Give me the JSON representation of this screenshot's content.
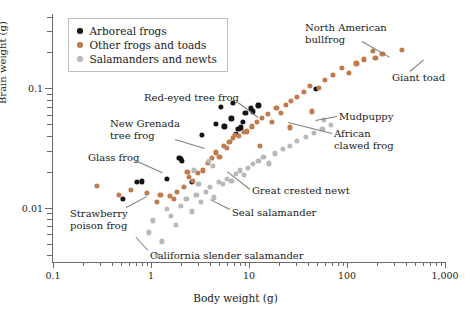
{
  "chart_data": {
    "type": "scatter",
    "title": "",
    "xlabel": "Body weight (g)",
    "ylabel": "Brain weight (g)",
    "xscale": "log",
    "yscale": "log",
    "xlim": [
      0.1,
      1000
    ],
    "ylim": [
      0.0035,
      0.42
    ],
    "xticks": [
      0.1,
      1,
      10,
      100,
      1000
    ],
    "xticklabels": [
      "0.1",
      "1",
      "10",
      "100",
      "1,000"
    ],
    "yticks": [
      0.01,
      0.1
    ],
    "yticklabels": [
      "0.01",
      "0.1"
    ],
    "grid": false,
    "legend_position": "top-left",
    "series": [
      {
        "name": "Arboreal frogs",
        "color": "#141414",
        "points": [
          [
            0.72,
            0.0163
          ],
          [
            0.8,
            0.0166
          ],
          [
            1.45,
            0.0175
          ],
          [
            1.95,
            0.0262
          ],
          [
            2.0,
            0.0255
          ],
          [
            2.05,
            0.0247
          ],
          [
            2.6,
            0.0163
          ],
          [
            3.3,
            0.041
          ],
          [
            4.6,
            0.0505
          ],
          [
            5.2,
            0.07
          ],
          [
            5.6,
            0.048
          ],
          [
            6.6,
            0.056
          ],
          [
            6.9,
            0.076
          ],
          [
            7.4,
            0.0415
          ],
          [
            7.8,
            0.0455
          ],
          [
            8.2,
            0.047
          ],
          [
            8.6,
            0.052
          ],
          [
            9.2,
            0.062
          ],
          [
            10.5,
            0.068
          ],
          [
            11.0,
            0.064
          ],
          [
            12.5,
            0.072
          ],
          [
            0.52,
            0.0118
          ],
          [
            48.0,
            0.099
          ]
        ]
      },
      {
        "name": "Other frogs and toads",
        "color": "#c07a4e",
        "points": [
          [
            0.47,
            0.0128
          ],
          [
            0.62,
            0.014
          ],
          [
            0.9,
            0.0132
          ],
          [
            1.15,
            0.0112
          ],
          [
            1.25,
            0.0128
          ],
          [
            1.55,
            0.0126
          ],
          [
            1.7,
            0.0118
          ],
          [
            1.85,
            0.0136
          ],
          [
            2.15,
            0.0148
          ],
          [
            2.35,
            0.02
          ],
          [
            2.45,
            0.0182
          ],
          [
            2.7,
            0.0168
          ],
          [
            3.0,
            0.0196
          ],
          [
            3.4,
            0.0205
          ],
          [
            3.8,
            0.0238
          ],
          [
            4.2,
            0.0262
          ],
          [
            4.6,
            0.029
          ],
          [
            5.0,
            0.0268
          ],
          [
            5.5,
            0.033
          ],
          [
            5.9,
            0.0315
          ],
          [
            6.3,
            0.0355
          ],
          [
            6.8,
            0.0385
          ],
          [
            7.2,
            0.0405
          ],
          [
            7.9,
            0.0398
          ],
          [
            8.8,
            0.043
          ],
          [
            9.6,
            0.0435
          ],
          [
            10.8,
            0.048
          ],
          [
            12.0,
            0.052
          ],
          [
            13.5,
            0.0565
          ],
          [
            15.5,
            0.061
          ],
          [
            17.0,
            0.052
          ],
          [
            19.0,
            0.069
          ],
          [
            21.0,
            0.062
          ],
          [
            24.0,
            0.073
          ],
          [
            27.0,
            0.079
          ],
          [
            31.0,
            0.085
          ],
          [
            36.0,
            0.093
          ],
          [
            42.0,
            0.105
          ],
          [
            52.0,
            0.101
          ],
          [
            60.0,
            0.118
          ],
          [
            72.0,
            0.13
          ],
          [
            88.0,
            0.148
          ],
          [
            105.0,
            0.135
          ],
          [
            125.0,
            0.162
          ],
          [
            150.0,
            0.175
          ],
          [
            185.0,
            0.205
          ],
          [
            195.0,
            0.18
          ],
          [
            230.0,
            0.195
          ],
          [
            360.0,
            0.21
          ],
          [
            0.28,
            0.0152
          ],
          [
            13.0,
            0.033
          ],
          [
            26.0,
            0.047
          ],
          [
            44.0,
            0.064
          ]
        ]
      },
      {
        "name": "Salamanders and newts",
        "color": "#b9b9b9",
        "points": [
          [
            0.95,
            0.0062
          ],
          [
            1.05,
            0.0078
          ],
          [
            1.3,
            0.0052
          ],
          [
            1.45,
            0.0098
          ],
          [
            1.6,
            0.0085
          ],
          [
            1.8,
            0.0072
          ],
          [
            2.0,
            0.0104
          ],
          [
            2.3,
            0.0118
          ],
          [
            2.6,
            0.0093
          ],
          [
            2.9,
            0.0128
          ],
          [
            3.2,
            0.0112
          ],
          [
            3.6,
            0.0135
          ],
          [
            4.0,
            0.015
          ],
          [
            4.4,
            0.0122
          ],
          [
            4.9,
            0.0163
          ],
          [
            5.4,
            0.0158
          ],
          [
            6.0,
            0.0175
          ],
          [
            6.6,
            0.0168
          ],
          [
            7.3,
            0.0192
          ],
          [
            8.0,
            0.0205
          ],
          [
            8.8,
            0.0188
          ],
          [
            9.8,
            0.0215
          ],
          [
            11.0,
            0.0232
          ],
          [
            12.5,
            0.0248
          ],
          [
            14.0,
            0.0268
          ],
          [
            16.0,
            0.0235
          ],
          [
            18.5,
            0.0285
          ],
          [
            22.0,
            0.031
          ],
          [
            26.0,
            0.033
          ],
          [
            31.0,
            0.036
          ],
          [
            38.0,
            0.039
          ],
          [
            46.0,
            0.042
          ],
          [
            56.0,
            0.0455
          ],
          [
            1.15,
            0.004
          ],
          [
            3.9,
            0.0245
          ],
          [
            4.3,
            0.0225
          ],
          [
            58.0,
            0.054
          ],
          [
            68.0,
            0.0495
          ],
          [
            2.75,
            0.0205
          ],
          [
            3.05,
            0.0158
          ]
        ]
      }
    ],
    "annotations": [
      {
        "id": "north-american-bullfrog",
        "text": "North American\nbullfrog",
        "x": 305,
        "y": 22,
        "leader": {
          "x1": 362,
          "y1": 41,
          "x2": 390,
          "y2": 57
        }
      },
      {
        "id": "giant-toad",
        "text": "Giant toad",
        "x": 392,
        "y": 72,
        "leader": {
          "x1": 410,
          "y1": 71,
          "x2": 424,
          "y2": 59
        }
      },
      {
        "id": "mudpuppy",
        "text": "Mudpuppy",
        "x": 339,
        "y": 111,
        "leader": {
          "x1": 337,
          "y1": 116,
          "x2": 315,
          "y2": 120
        }
      },
      {
        "id": "african-clawed-frog",
        "text": "African\nclawed frog",
        "x": 334,
        "y": 128,
        "leader": {
          "x1": 332,
          "y1": 133,
          "x2": 288,
          "y2": 122
        }
      },
      {
        "id": "red-eyed-tree-frog",
        "text": "Red-eyed tree frog",
        "x": 144,
        "y": 92,
        "leader": {
          "x1": 238,
          "y1": 102,
          "x2": 258,
          "y2": 117
        }
      },
      {
        "id": "new-grenada-tree-frog",
        "text": "New Grenada\ntree frog",
        "x": 110,
        "y": 118,
        "leader": {
          "x1": 175,
          "y1": 139,
          "x2": 205,
          "y2": 148
        }
      },
      {
        "id": "glass-frog",
        "text": "Glass frog",
        "x": 88,
        "y": 152,
        "leader": {
          "x1": 135,
          "y1": 160,
          "x2": 162,
          "y2": 172
        }
      },
      {
        "id": "strawberry-poison-frog",
        "text": "Strawberry\npoison frog",
        "x": 70,
        "y": 208,
        "leader": {
          "x1": 126,
          "y1": 207,
          "x2": 147,
          "y2": 196
        }
      },
      {
        "id": "great-crested-newt",
        "text": "Great crested newt",
        "x": 252,
        "y": 185,
        "leader": {
          "x1": 250,
          "y1": 189,
          "x2": 227,
          "y2": 171
        }
      },
      {
        "id": "seal-salamander",
        "text": "Seal salamander",
        "x": 232,
        "y": 207,
        "leader": {
          "x1": 230,
          "y1": 209,
          "x2": 210,
          "y2": 199
        }
      },
      {
        "id": "california-slender-salamander",
        "text": "California slender salamander",
        "x": 150,
        "y": 250,
        "leader": {
          "x1": 148,
          "y1": 250,
          "x2": 136,
          "y2": 237
        }
      }
    ]
  },
  "legend": {
    "items": [
      {
        "label": "Arboreal frogs",
        "color": "#141414"
      },
      {
        "label": "Other frogs and toads",
        "color": "#c07a4e"
      },
      {
        "label": "Salamanders and newts",
        "color": "#b9b9b9"
      }
    ]
  }
}
